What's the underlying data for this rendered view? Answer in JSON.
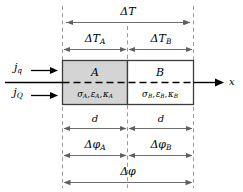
{
  "figure": {
    "colors": {
      "region_a_fill": "#d4d4d4",
      "region_b_fill": "#ffffff",
      "outline": "#3c3c3c",
      "dashed_guide": "#9a9a9a",
      "dimension_line": "#6e6e6e",
      "axis": "#000000",
      "text": "#000000"
    },
    "fluxes": [
      {
        "id": "heat-flux-q",
        "label": "j",
        "subscript": "q"
      },
      {
        "id": "heat-flux-Q",
        "label": "j",
        "subscript": "Q"
      }
    ],
    "regions": [
      {
        "id": "region-a",
        "name": "A",
        "properties": "σA , εA , κA",
        "properties_parts": [
          {
            "sym": "σ",
            "sub": "A"
          },
          {
            "sym": "ε",
            "sub": "A"
          },
          {
            "sym": "κ",
            "sub": "A"
          }
        ],
        "shaded": true
      },
      {
        "id": "region-b",
        "name": "B",
        "properties": "σB , εB , κB",
        "properties_parts": [
          {
            "sym": "σ",
            "sub": "B"
          },
          {
            "sym": "ε",
            "sub": "B"
          },
          {
            "sym": "κ",
            "sub": "B"
          }
        ],
        "shaded": false
      }
    ],
    "axis": {
      "id": "x-axis",
      "label": "x"
    },
    "dimensions": {
      "delta_T_total": {
        "sym": "ΔT",
        "sub": "",
        "span": "full"
      },
      "delta_T_a": {
        "sym": "ΔT",
        "sub": "A",
        "span": "left"
      },
      "delta_T_b": {
        "sym": "ΔT",
        "sub": "B",
        "span": "right"
      },
      "thickness_a": {
        "sym": "d",
        "sub": "",
        "span": "left"
      },
      "thickness_b": {
        "sym": "d",
        "sub": "",
        "span": "right"
      },
      "delta_phi_a": {
        "sym": "Δφ",
        "sub": "A",
        "span": "left"
      },
      "delta_phi_b": {
        "sym": "Δφ",
        "sub": "B",
        "span": "right"
      },
      "delta_phi_total": {
        "sym": "Δφ",
        "sub": "",
        "span": "full"
      }
    }
  }
}
